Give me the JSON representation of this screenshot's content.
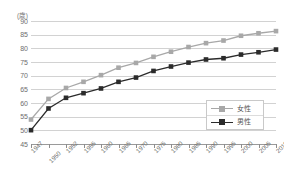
{
  "chart_data": {
    "type": "line",
    "title": "",
    "xlabel": "",
    "ylabel": "(歳)",
    "unit_label": "(歳)",
    "ylim": [
      45,
      90
    ],
    "ytick_step": 5,
    "yticks": [
      90,
      85,
      80,
      75,
      70,
      65,
      60,
      55,
      50,
      45
    ],
    "grid": true,
    "legend_position": "bottom-right",
    "categories": [
      "1947",
      "1950",
      "1952",
      "1955",
      "1960",
      "1965",
      "1970",
      "1975",
      "1980",
      "1985",
      "1990",
      "1995",
      "2000",
      "2005",
      "2010"
    ],
    "xtick_labels": [
      "1947",
      "1950",
      "1952",
      "1955",
      "1960",
      "1965",
      "1970",
      "1975",
      "1980",
      "1985",
      "1990",
      "1995",
      "2000",
      "2005",
      "2010"
    ],
    "series": [
      {
        "name": "女性",
        "color": "#a8a8a8",
        "marker": "square",
        "values": [
          53.96,
          61.5,
          65.5,
          67.75,
          70.19,
          72.92,
          74.66,
          76.89,
          78.76,
          80.48,
          81.9,
          82.85,
          84.6,
          85.52,
          86.3
        ]
      },
      {
        "name": "男性",
        "color": "#2b2b2b",
        "marker": "square",
        "values": [
          50.06,
          58.0,
          61.9,
          63.6,
          65.32,
          67.74,
          69.31,
          71.73,
          73.35,
          74.78,
          75.92,
          76.38,
          77.72,
          78.56,
          79.55
        ]
      }
    ]
  },
  "legend": {
    "items": [
      {
        "label": "女性",
        "color": "#a8a8a8"
      },
      {
        "label": "男性",
        "color": "#2b2b2b"
      }
    ]
  }
}
